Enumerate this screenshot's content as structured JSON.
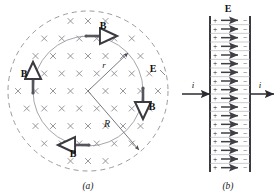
{
  "figure": {
    "panels": [
      {
        "id": "a",
        "caption": "(a)",
        "description": "End view of circular capacitor plate showing induced magnetic field B circling the uniform electric field E directed into the page",
        "field_symbol": "×",
        "field_symbol_name": "into-page-cross",
        "field_symbol_count": 74,
        "labels": {
          "E": "E",
          "B": "B",
          "r": "r",
          "R": "R"
        },
        "vectors": [
          {
            "name": "B-top",
            "label": "B",
            "direction": "right"
          },
          {
            "name": "B-left",
            "label": "B",
            "direction": "up"
          },
          {
            "name": "B-right",
            "label": "B",
            "direction": "down"
          },
          {
            "name": "B-bottom",
            "label": "B",
            "direction": "left"
          }
        ],
        "radii": [
          {
            "name": "r",
            "label": "r",
            "target": "inner-solid-circle"
          },
          {
            "name": "R",
            "label": "R",
            "target": "outer-dashed-circle"
          }
        ],
        "circles": [
          {
            "name": "inner-solid-circle",
            "style": "solid",
            "radius_label": "r"
          },
          {
            "name": "outer-dashed-circle",
            "style": "dashed",
            "radius_label": "R"
          }
        ]
      },
      {
        "id": "b",
        "caption": "(b)",
        "description": "Side view of parallel plate capacitor with charge signs and electric field arrows, current i entering and leaving",
        "labels": {
          "E": "E",
          "current_left": "i",
          "current_right": "i",
          "plus": "+",
          "minus": "−"
        },
        "rows": 18,
        "current_arrows": [
          {
            "name": "current-in",
            "label": "i",
            "direction": "right"
          },
          {
            "name": "current-out",
            "label": "i",
            "direction": "right"
          }
        ]
      }
    ]
  },
  "colors": {
    "ink": "#1a1a1a",
    "cross": "#8b8b93",
    "circle": "#9a9aa2",
    "plate": "#55555c",
    "arrow": "#3a3a40",
    "efield": "#4a4a50"
  }
}
